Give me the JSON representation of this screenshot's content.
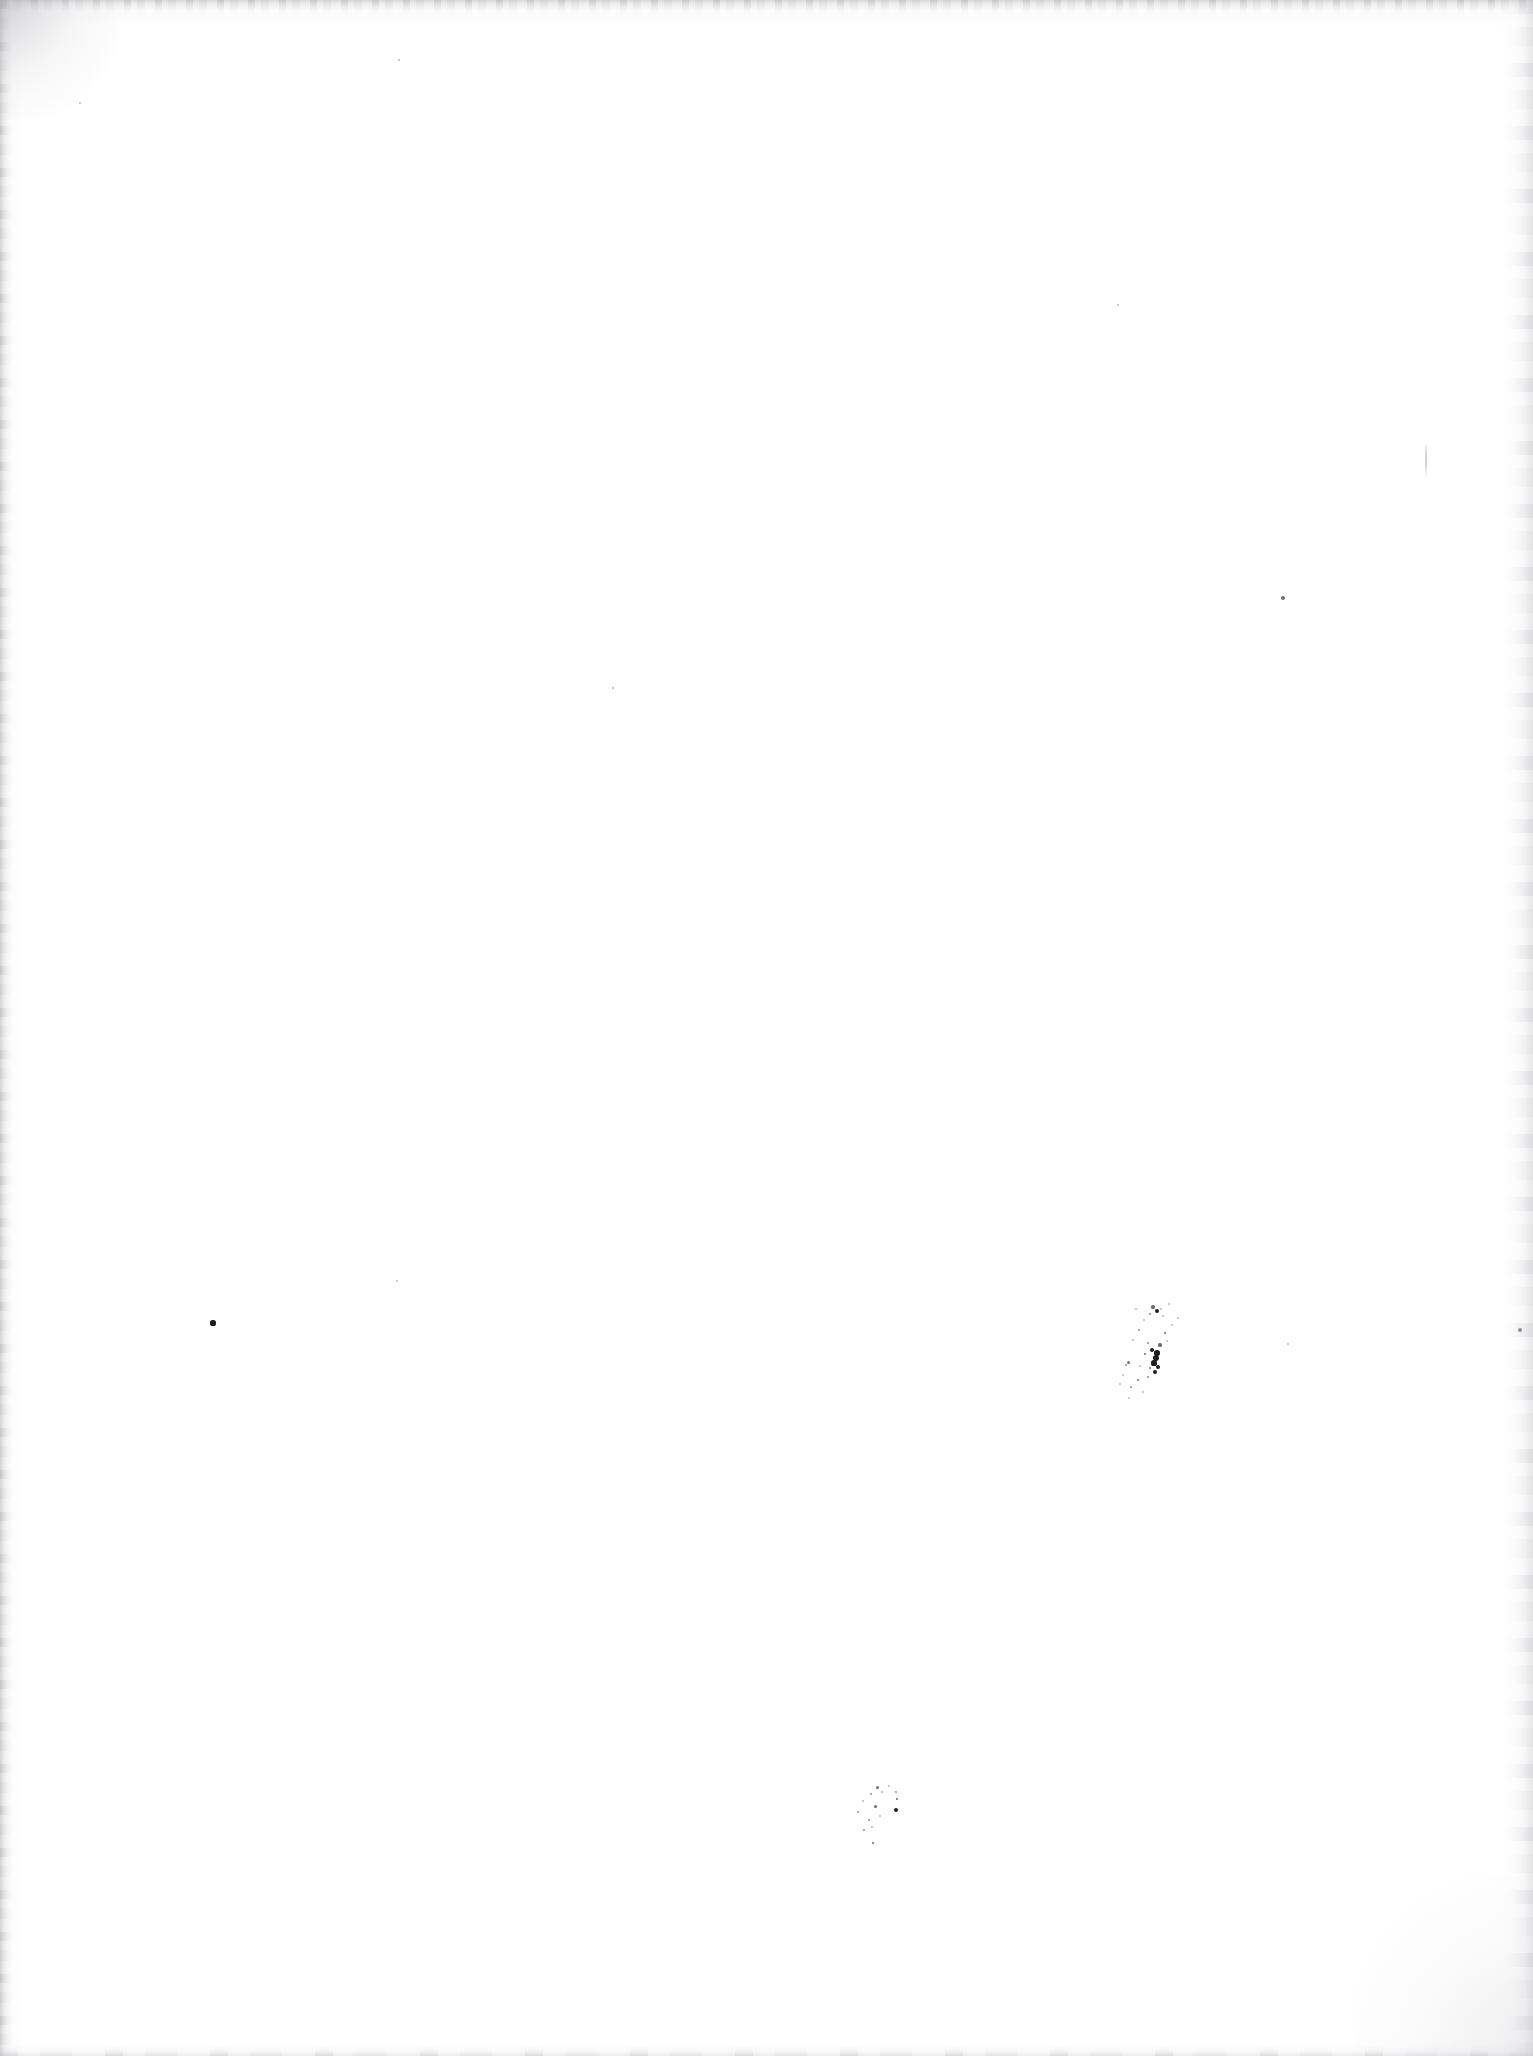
{
  "page": {
    "kind": "scanned-blank-page",
    "width": 1533,
    "height": 2056,
    "paper_color": "#ffffff",
    "ink_color": "#1d1d1d",
    "edge_shadow_color": "#b0b0b4",
    "caption": "",
    "visible_text": ""
  },
  "marks": {
    "primary_spatter": {
      "label": "ink-spatter-primary",
      "bounds": {
        "x": 1118,
        "y": 1302,
        "w": 70,
        "h": 100
      },
      "dots": [
        {
          "x": 1153,
          "y": 1307,
          "r": 1.6,
          "tone": "mid"
        },
        {
          "x": 1157,
          "y": 1311,
          "r": 2.4,
          "tone": "dark"
        },
        {
          "x": 1161,
          "y": 1309,
          "r": 1.2,
          "tone": "faint"
        },
        {
          "x": 1150,
          "y": 1314,
          "r": 1.4,
          "tone": "soft"
        },
        {
          "x": 1163,
          "y": 1316,
          "r": 1.0,
          "tone": "faint"
        },
        {
          "x": 1144,
          "y": 1320,
          "r": 1.0,
          "tone": "faint"
        },
        {
          "x": 1169,
          "y": 1304,
          "r": 1.0,
          "tone": "faint"
        },
        {
          "x": 1139,
          "y": 1330,
          "r": 1.2,
          "tone": "soft"
        },
        {
          "x": 1165,
          "y": 1333,
          "r": 1.4,
          "tone": "mid"
        },
        {
          "x": 1133,
          "y": 1340,
          "r": 1.1,
          "tone": "faint"
        },
        {
          "x": 1148,
          "y": 1343,
          "r": 1.3,
          "tone": "soft"
        },
        {
          "x": 1160,
          "y": 1345,
          "r": 1.6,
          "tone": "mid"
        },
        {
          "x": 1167,
          "y": 1341,
          "r": 1.2,
          "tone": "faint"
        },
        {
          "x": 1152,
          "y": 1350,
          "r": 2.2,
          "tone": "dark"
        },
        {
          "x": 1157,
          "y": 1353,
          "r": 2.8,
          "tone": "dark"
        },
        {
          "x": 1145,
          "y": 1354,
          "r": 1.4,
          "tone": "mid"
        },
        {
          "x": 1156,
          "y": 1358,
          "r": 3.2,
          "tone": "dark"
        },
        {
          "x": 1154,
          "y": 1363,
          "r": 2.6,
          "tone": "dark"
        },
        {
          "x": 1158,
          "y": 1367,
          "r": 2.0,
          "tone": "dark"
        },
        {
          "x": 1150,
          "y": 1368,
          "r": 1.3,
          "tone": "mid"
        },
        {
          "x": 1155,
          "y": 1372,
          "r": 2.4,
          "tone": "dark"
        },
        {
          "x": 1140,
          "y": 1366,
          "r": 1.1,
          "tone": "faint"
        },
        {
          "x": 1128,
          "y": 1362,
          "r": 1.5,
          "tone": "mid"
        },
        {
          "x": 1126,
          "y": 1365,
          "r": 1.2,
          "tone": "soft"
        },
        {
          "x": 1148,
          "y": 1377,
          "r": 1.2,
          "tone": "soft"
        },
        {
          "x": 1138,
          "y": 1380,
          "r": 1.3,
          "tone": "mid"
        },
        {
          "x": 1123,
          "y": 1375,
          "r": 1.0,
          "tone": "faint"
        },
        {
          "x": 1131,
          "y": 1387,
          "r": 1.4,
          "tone": "soft"
        },
        {
          "x": 1120,
          "y": 1384,
          "r": 1.1,
          "tone": "faint"
        },
        {
          "x": 1143,
          "y": 1392,
          "r": 1.0,
          "tone": "faint"
        },
        {
          "x": 1129,
          "y": 1398,
          "r": 1.2,
          "tone": "faint"
        },
        {
          "x": 1172,
          "y": 1325,
          "r": 0.9,
          "tone": "faint"
        },
        {
          "x": 1178,
          "y": 1318,
          "r": 1.0,
          "tone": "faint"
        },
        {
          "x": 1136,
          "y": 1309,
          "r": 0.9,
          "tone": "faint"
        }
      ]
    },
    "secondary_spatter": {
      "label": "ink-spatter-secondary",
      "bounds": {
        "x": 850,
        "y": 1782,
        "w": 56,
        "h": 66
      },
      "dots": [
        {
          "x": 877,
          "y": 1787,
          "r": 1.5,
          "tone": "mid"
        },
        {
          "x": 889,
          "y": 1786,
          "r": 1.1,
          "tone": "faint"
        },
        {
          "x": 882,
          "y": 1792,
          "r": 1.0,
          "tone": "faint"
        },
        {
          "x": 896,
          "y": 1792,
          "r": 1.4,
          "tone": "soft"
        },
        {
          "x": 871,
          "y": 1794,
          "r": 1.2,
          "tone": "soft"
        },
        {
          "x": 897,
          "y": 1799,
          "r": 1.3,
          "tone": "mid"
        },
        {
          "x": 863,
          "y": 1801,
          "r": 1.0,
          "tone": "faint"
        },
        {
          "x": 875,
          "y": 1806,
          "r": 1.5,
          "tone": "mid"
        },
        {
          "x": 896,
          "y": 1810,
          "r": 2.0,
          "tone": "dark"
        },
        {
          "x": 858,
          "y": 1812,
          "r": 1.3,
          "tone": "soft"
        },
        {
          "x": 880,
          "y": 1816,
          "r": 1.2,
          "tone": "faint"
        },
        {
          "x": 869,
          "y": 1820,
          "r": 1.4,
          "tone": "soft"
        },
        {
          "x": 872,
          "y": 1827,
          "r": 1.1,
          "tone": "faint"
        },
        {
          "x": 864,
          "y": 1830,
          "r": 1.2,
          "tone": "soft"
        },
        {
          "x": 873,
          "y": 1843,
          "r": 1.4,
          "tone": "mid"
        }
      ]
    },
    "isolated_dots": [
      {
        "label": "ink-dot-left",
        "x": 213,
        "y": 1323,
        "r": 2.6,
        "tone": "dark"
      },
      {
        "label": "speck-upper-right",
        "x": 1283,
        "y": 598,
        "r": 2.1,
        "tone": "mid"
      },
      {
        "label": "speck-right-edge",
        "x": 1520,
        "y": 1330,
        "r": 2.0,
        "tone": "soft"
      },
      {
        "label": "speck-upper-left",
        "x": 399,
        "y": 60,
        "r": 1.1,
        "tone": "faint"
      },
      {
        "label": "speck-mid-left",
        "x": 80,
        "y": 103,
        "r": 1.0,
        "tone": "faint"
      },
      {
        "label": "speck-center",
        "x": 613,
        "y": 688,
        "r": 1.1,
        "tone": "faint"
      },
      {
        "label": "speck-lower-center",
        "x": 397,
        "y": 1281,
        "r": 1.0,
        "tone": "faint"
      },
      {
        "label": "speck-upper-mid",
        "x": 1118,
        "y": 305,
        "r": 1.0,
        "tone": "faint"
      },
      {
        "label": "speck-lower-right",
        "x": 1288,
        "y": 1344,
        "r": 1.0,
        "tone": "faint"
      }
    ],
    "crease": {
      "label": "scan-crease-line",
      "x": 1425,
      "y": 443,
      "w": 2,
      "h": 36
    }
  }
}
